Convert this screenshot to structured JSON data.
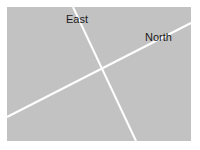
{
  "diagram": {
    "background_color": "#c2c2c2",
    "line_color": "#ffffff",
    "axes": [
      {
        "label": "East",
        "from": [
          73,
          7
        ],
        "to": [
          136,
          141
        ]
      },
      {
        "label": "North",
        "from": [
          7,
          117
        ],
        "to": [
          191,
          23
        ]
      }
    ],
    "labels": {
      "east": "East",
      "north": "North"
    }
  }
}
